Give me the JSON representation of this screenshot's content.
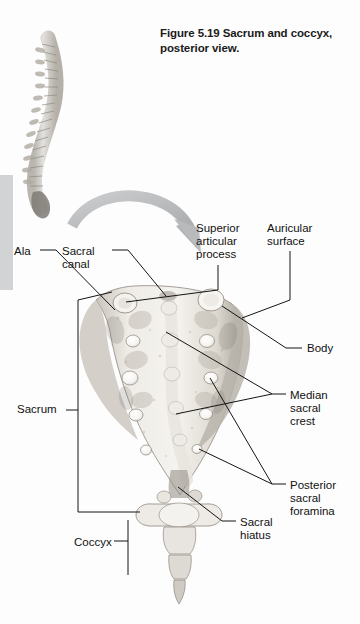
{
  "figure": {
    "number": "Figure 5.19",
    "caption": "Sacrum and coccyx, posterior view.",
    "full_caption": "Figure 5.19  Sacrum and coccyx, posterior view."
  },
  "labels": {
    "ala": "Ala",
    "sacral_canal": "Sacral\ncanal",
    "sacrum": "Sacrum",
    "coccyx": "Coccyx",
    "superior_articular_process": "Superior\narticular\nprocess",
    "auricular_surface": "Auricular\nsurface",
    "body": "Body",
    "median_sacral_crest": "Median\nsacral\ncrest",
    "posterior_sacral_foramina": "Posterior\nsacral\nforamina",
    "sacral_hiatus": "Sacral\nhiatus"
  },
  "illustrations": {
    "vertebral_column": "vertebral-column-lateral-view",
    "sacrum_bone": "sacrum-coccyx-posterior-photograph",
    "orientation_arrow": "curved-arrow-icon"
  },
  "colors": {
    "page_background": "#fdfdfd",
    "margin_bar": "#d2d3d5",
    "arrow": "#b9babc",
    "bone_light": "#f2f0ec",
    "bone_mid": "#d8d4cd",
    "bone_shadow": "#9a958d",
    "leader_line": "#141414",
    "text": "#111111"
  }
}
